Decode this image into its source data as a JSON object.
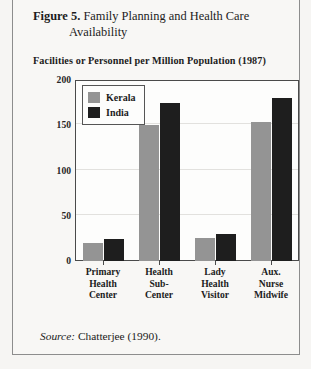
{
  "figure": {
    "number_label": "Figure 5.",
    "title_line1": "Family Planning and Health Care",
    "title_line2": "Availability",
    "source_label": "Source:",
    "source_text": "Chatterjee (1990)."
  },
  "chart_data": {
    "type": "bar",
    "title": "Facilities or Personnel per Million Population (1987)",
    "xlabel": "",
    "ylabel": "",
    "ylim": [
      0,
      200
    ],
    "yticks": [
      0,
      50,
      100,
      150,
      200
    ],
    "ytick_labels": [
      "0",
      "50",
      "100",
      "150",
      "200"
    ],
    "grid": true,
    "legend_position": "top-left",
    "categories": [
      "Primary Health Center",
      "Health Sub-Center",
      "Lady Health Visitor",
      "Aux. Nurse Midwife"
    ],
    "category_lines": [
      [
        "Primary",
        "Health",
        "Center"
      ],
      [
        "Health",
        "Sub-",
        "Center"
      ],
      [
        "Lady",
        "Health",
        "Visitor"
      ],
      [
        "Aux.",
        "Nurse",
        "Midwife"
      ]
    ],
    "series": [
      {
        "name": "Kerala",
        "color": "#949494",
        "values": [
          20,
          150,
          25,
          154
        ]
      },
      {
        "name": "India",
        "color": "#1e1e1e",
        "values": [
          24,
          175,
          30,
          180
        ]
      }
    ]
  }
}
